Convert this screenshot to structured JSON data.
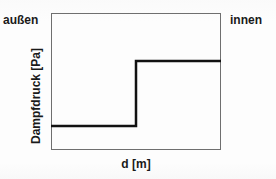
{
  "figure": {
    "type": "step-diagram",
    "background_color": "#fdfdfd",
    "frame_color": "#6f6f6f",
    "curve_color": "#111111"
  },
  "labels": {
    "outside": "außen",
    "inside": "innen",
    "y_axis": "Dampfdruck [Pa]",
    "x_axis": "d [m]"
  },
  "chart_data": {
    "type": "line",
    "title": "",
    "subtitle": "",
    "xlabel": "d [m]",
    "ylabel": "Dampfdruck [Pa]",
    "grid": false,
    "legend": null,
    "axis_ticks": {
      "x": [],
      "y": []
    },
    "xlim": [
      0,
      1
    ],
    "ylim": [
      0,
      1
    ],
    "annotations": [
      {
        "text": "außen",
        "position": "top-left-outside"
      },
      {
        "text": "innen",
        "position": "top-right-outside"
      }
    ],
    "series": [
      {
        "name": "Dampfdruck",
        "style": "step",
        "linewidth": 2.5,
        "color": "#111111",
        "x": [
          0.0,
          0.5,
          0.5,
          1.0
        ],
        "y": [
          0.175,
          0.175,
          0.65,
          0.65
        ]
      }
    ]
  }
}
